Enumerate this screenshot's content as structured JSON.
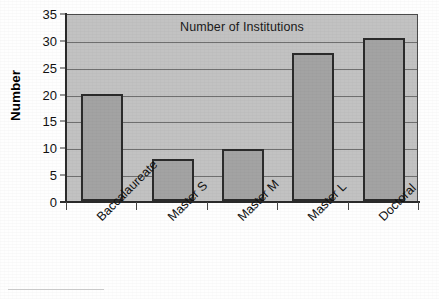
{
  "chart_data": {
    "type": "bar",
    "title": "Number of Institutions",
    "xlabel": "",
    "ylabel": "Number",
    "categories": [
      "Baccalaureate",
      "Master S",
      "Master M",
      "Master L",
      "Doctoral"
    ],
    "values": [
      20,
      7.8,
      9.7,
      27.5,
      30.4
    ],
    "ylim": [
      0,
      35
    ],
    "yticks": [
      0,
      5,
      10,
      15,
      20,
      25,
      30,
      35
    ],
    "ytick_labels": [
      "0",
      "5",
      "10",
      "15",
      "20",
      "25",
      "30",
      "35"
    ],
    "grid": "horizontal",
    "legend": "none",
    "colors": {
      "bar_fill": "#a3a3a3",
      "bar_border": "#2b2b2b",
      "plot_background": "#c2c2c2",
      "grid_line": "#6f6f6f",
      "axis": "#2a2a2a",
      "text": "#111111"
    }
  }
}
